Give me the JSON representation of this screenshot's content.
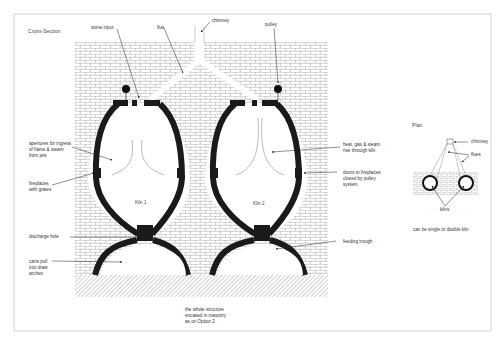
{
  "diagram": {
    "sections": {
      "cross_section_title": "Cross-Section",
      "plan_title": "Plan"
    },
    "kilns": [
      {
        "label": "Kiln 1"
      },
      {
        "label": "Kiln 2"
      }
    ],
    "callouts": {
      "stone_input": "stone input",
      "flue": "flue",
      "chimney": "chimney",
      "pulley": "pulley",
      "apertures": "apertures for ingress\nof flame & steam\nfrom jets",
      "fireplaces": "fireplaces\nwith grates",
      "discharge_hole": "discharge hole",
      "carts": "carts pull\ninto draw\narches",
      "heat_gas": "heat, gas & steam\nrise through kiln",
      "doors": "doors to fireplaces\nclosed by pulley\nsystem",
      "feeding_trough": "feeding trough",
      "masonry_note": "the whole structure\nencased in masonry\nas on Option 2"
    },
    "plan": {
      "chimney": "chimney",
      "flues": "flues",
      "kilns": "kilns",
      "note": "can be single or double kiln"
    },
    "colors": {
      "frame": "#c8c8c8",
      "brick_line": "#9a9a9a",
      "kiln_wall": "#1a1a1a",
      "hatch": "#8c8c8c",
      "text": "#333333"
    }
  }
}
